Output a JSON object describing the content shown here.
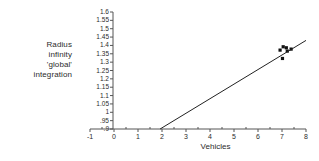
{
  "chart_data": {
    "type": "scatter",
    "title": "",
    "xlabel": "Vehicles",
    "ylabel": "Radius infinity 'global' integration",
    "ylabel_lines": [
      "Radius",
      "infinity",
      "'global'",
      "integration"
    ],
    "xlim": [
      -1,
      8
    ],
    "ylim": [
      0.9,
      1.6
    ],
    "grid": false,
    "legend": "none",
    "xticks": [
      "-1",
      "0",
      "1",
      "2",
      "3",
      "4",
      "5",
      "6",
      "7",
      "8"
    ],
    "xtick_values": [
      -1,
      0,
      1,
      2,
      3,
      4,
      5,
      6,
      7,
      8
    ],
    "yticks": [
      "1.6",
      "1.55",
      "1.5",
      "1.45",
      "1.4",
      "1.35",
      "1.3",
      "1.25",
      "1.2",
      "1.15",
      "1.1",
      "1.05",
      "1",
      ".95",
      ".9"
    ],
    "ytick_values": [
      1.6,
      1.55,
      1.5,
      1.45,
      1.4,
      1.35,
      1.3,
      1.25,
      1.2,
      1.15,
      1.1,
      1.05,
      1.0,
      0.95,
      0.9
    ],
    "series": [
      {
        "name": "data points",
        "marker": "square",
        "color": "#111111",
        "points": [
          {
            "x": 6.92,
            "y": 1.372
          },
          {
            "x": 7.05,
            "y": 1.392
          },
          {
            "x": 7.18,
            "y": 1.386
          },
          {
            "x": 7.22,
            "y": 1.366
          },
          {
            "x": 7.38,
            "y": 1.378
          },
          {
            "x": 7.02,
            "y": 1.322
          }
        ]
      },
      {
        "name": "trend line",
        "marker": "none",
        "color": "#222222",
        "line": {
          "x_start": 1.92,
          "y_start": 0.9,
          "x_end": 8.0,
          "y_end": 1.43
        }
      }
    ],
    "axis_color": "#555555"
  }
}
